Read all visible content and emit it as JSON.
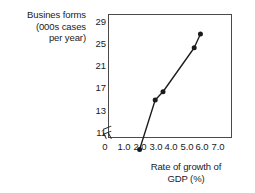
{
  "chart_data": {
    "type": "line",
    "title": "",
    "ylabel": "Busines forms (000s cases per year)",
    "ylabel_lines": [
      "Busines forms",
      "(000s cases",
      "per year)"
    ],
    "xlabel": "Rate of growth of GDP (%)",
    "xlabel_lines": [
      "Rate of growth of",
      "GDP (%)"
    ],
    "x": [
      2.0,
      3.0,
      3.5,
      5.5,
      5.9
    ],
    "values": [
      11.5,
      15.0,
      16.5,
      24.5,
      27.0
    ],
    "series": [
      {
        "name": "Business forms vs GDP growth",
        "points": [
          {
            "x": 2.0,
            "y": 11.5
          },
          {
            "x": 3.0,
            "y": 15.0
          },
          {
            "x": 3.5,
            "y": 16.5
          },
          {
            "x": 5.5,
            "y": 24.5
          },
          {
            "x": 5.9,
            "y": 27.0
          }
        ]
      }
    ],
    "xticks": [
      "0",
      "1.0",
      "2.0",
      "3.0",
      "4.0",
      "5.0",
      "6.0",
      "7.0"
    ],
    "xtick_values": [
      0,
      1.0,
      2.0,
      3.0,
      4.0,
      5.0,
      6.0,
      7.0
    ],
    "yticks": [
      "11",
      "13",
      "17",
      "21",
      "25",
      "29"
    ],
    "ytick_values": [
      11,
      13,
      17,
      21,
      25,
      29
    ],
    "xlim": [
      0.6,
      7.4
    ],
    "ylim": [
      11,
      29
    ],
    "grid": false,
    "legend": "none",
    "axis_break_x": true,
    "axis_break_y": true,
    "marker": "filled-circle",
    "line_color": "#1a1a1a",
    "marker_color": "#1a1a1a",
    "frame_color": "#4a4a4a",
    "background_color": "#ffffff"
  }
}
